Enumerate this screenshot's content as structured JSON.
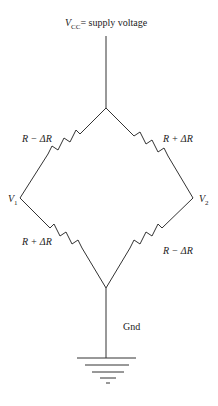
{
  "supply": {
    "symbol": "V",
    "sub": "CC",
    "text": "= supply voltage"
  },
  "resistors": {
    "top_left": "R − ΔR",
    "top_right": "R + ΔR",
    "bottom_left": "R + ΔR",
    "bottom_right": "R − ΔR"
  },
  "nodes": {
    "left": {
      "symbol": "V",
      "sub": "1"
    },
    "right": {
      "symbol": "V",
      "sub": "2"
    }
  },
  "ground_label": "Gnd"
}
